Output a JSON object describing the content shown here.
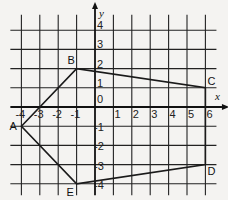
{
  "diagram": {
    "type": "coordinate-grid-polygon",
    "axes": {
      "x_label": "x",
      "y_label": "y",
      "origin_label": "0",
      "x_ticks": [
        "-4",
        "-3",
        "-2",
        "-1",
        "1",
        "2",
        "3",
        "4",
        "5",
        "6"
      ],
      "y_ticks": [
        "4",
        "3",
        "2",
        "1",
        "-1",
        "-2",
        "-3",
        "-4"
      ]
    },
    "points": [
      {
        "name": "A",
        "x": -4,
        "y": -1
      },
      {
        "name": "B",
        "x": -1,
        "y": 2
      },
      {
        "name": "C",
        "x": 6,
        "y": 1
      },
      {
        "name": "D",
        "x": 6,
        "y": -3
      },
      {
        "name": "E",
        "x": -1,
        "y": -4
      }
    ],
    "colors": {
      "line": "#1a1a1a",
      "background": "#f4f3f1"
    }
  }
}
